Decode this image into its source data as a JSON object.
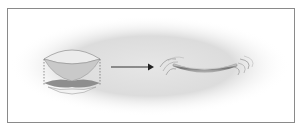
{
  "diagram": {
    "colors": {
      "background_glow": "#d6d6d6",
      "frame_border": "#8a8a8a",
      "lens_top_fill": "#e4e4e4",
      "lens_inner_fill": "#c8c8c8",
      "lens_bottom_fill": "#9a9a9a",
      "arrow": "#333333",
      "sheet": "#7a7a7a"
    },
    "elements": [
      {
        "name": "lens-object",
        "label": ""
      },
      {
        "name": "transformation-arrow",
        "label": ""
      },
      {
        "name": "curved-sheet-with-waves",
        "label": ""
      }
    ]
  }
}
